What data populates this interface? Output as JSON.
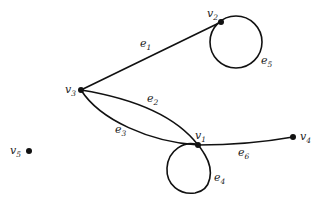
{
  "graph": {
    "vertices": [
      {
        "id": "v1",
        "label_base": "v",
        "label_sub": "1",
        "x": 198,
        "y": 145
      },
      {
        "id": "v2",
        "label_base": "v",
        "label_sub": "2",
        "x": 221,
        "y": 22
      },
      {
        "id": "v3",
        "label_base": "v",
        "label_sub": "3",
        "x": 81,
        "y": 90
      },
      {
        "id": "v4",
        "label_base": "v",
        "label_sub": "4",
        "x": 293,
        "y": 137
      },
      {
        "id": "v5",
        "label_base": "v",
        "label_sub": "5",
        "x": 29,
        "y": 151
      }
    ],
    "edges": [
      {
        "id": "e1",
        "label_base": "e",
        "label_sub": "1",
        "from": "v3",
        "to": "v2",
        "type": "straight"
      },
      {
        "id": "e2",
        "label_base": "e",
        "label_sub": "2",
        "from": "v3",
        "to": "v1",
        "type": "curve-upper"
      },
      {
        "id": "e3",
        "label_base": "e",
        "label_sub": "3",
        "from": "v3",
        "to": "v1",
        "type": "curve-lower"
      },
      {
        "id": "e4",
        "label_base": "e",
        "label_sub": "4",
        "from": "v1",
        "to": "v1",
        "type": "loop"
      },
      {
        "id": "e5",
        "label_base": "e",
        "label_sub": "5",
        "from": "v2",
        "to": "v2",
        "type": "loop"
      },
      {
        "id": "e6",
        "label_base": "e",
        "label_sub": "6",
        "from": "v1",
        "to": "v4",
        "type": "straight"
      }
    ],
    "colors": {
      "stroke": "#111111",
      "background": "#ffffff"
    }
  }
}
